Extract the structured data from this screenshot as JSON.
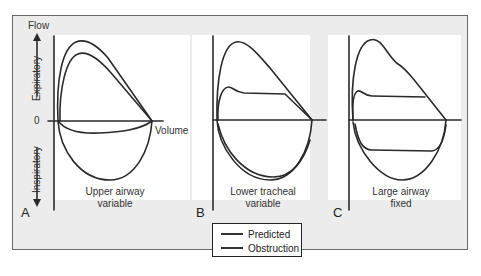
{
  "figure": {
    "axis": {
      "y_label": "Flow",
      "x_label": "Volume",
      "zero_label": "0",
      "upper_direction": "Expiratory",
      "lower_direction": "Inspiratory"
    },
    "panels": [
      {
        "letter": "A",
        "caption_line1": "Upper airway",
        "caption_line2": "variable"
      },
      {
        "letter": "B",
        "caption_line1": "Lower tracheal",
        "caption_line2": "variable"
      },
      {
        "letter": "C",
        "caption_line1": "Large airway",
        "caption_line2": "fixed"
      }
    ],
    "legend": {
      "items": [
        {
          "label": "Predicted"
        },
        {
          "label": "Obstruction"
        }
      ]
    },
    "colors": {
      "frame_bg": "#ececec",
      "panel_bg": "#ffffff",
      "line": "#2a2a2a"
    }
  }
}
